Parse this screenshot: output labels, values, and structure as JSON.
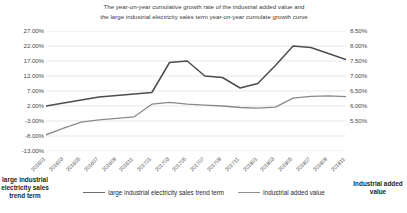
{
  "chart_data": {
    "type": "line",
    "title": "The year-on-year cumulative growth rate of the industrial added value and the large industrial electricity sales term year-on-year cumulate growth curve",
    "title_line1": "The year-on-year cumulative growth rate of the industrial added value and",
    "title_line2": "the large industrial electricity sales term year-on-year cumulate growth curve",
    "xlabel": "",
    "ylabel_left": "large industrial electricity sales trend term",
    "ylabel_right": "Industrial added value",
    "grid": true,
    "legend_position": "bottom",
    "x": [
      "201601",
      "201603",
      "201605",
      "201607",
      "201609",
      "201611",
      "201701",
      "201703",
      "201705",
      "201707",
      "201709",
      "201711",
      "201801",
      "201803",
      "201805",
      "201807",
      "201809",
      "201811"
    ],
    "xtick_labels": [
      "201601",
      "201603",
      "201605",
      "201607",
      "201609",
      "201611",
      "201701",
      "201703",
      "201705",
      "201707",
      "201709",
      "201711",
      "201801",
      "201803",
      "201805",
      "201807",
      "201809",
      "201811"
    ],
    "ylim_left": [
      -13.0,
      27.0
    ],
    "ytick_labels_left": [
      "27.00%",
      "22.00%",
      "17.00%",
      "12.00%",
      "7.00%",
      "2.00%",
      "-3.00%",
      "-8.00%",
      "-13.00%"
    ],
    "ytick_values_left": [
      27.0,
      22.0,
      17.0,
      12.0,
      7.0,
      2.0,
      -3.0,
      -8.0,
      -13.0
    ],
    "ylim_right": [
      5.5,
      8.5
    ],
    "ytick_labels_right": [
      "8.50%",
      "8.00%",
      "7.50%",
      "7.00%",
      "6.50%",
      "6.00%",
      "5.50%"
    ],
    "ytick_values_right": [
      8.5,
      8.0,
      7.5,
      7.0,
      6.5,
      6.0,
      5.5
    ],
    "series": [
      {
        "name": "large industrial electricity sales trend term",
        "axis": "left",
        "color": "#8a8a8a",
        "values": [
          -7.6,
          -5.4,
          -3.4,
          -2.6,
          -2.1,
          -1.6,
          2.6,
          3.2,
          2.6,
          2.3,
          2.0,
          1.5,
          1.3,
          1.6,
          4.6,
          5.2,
          5.4,
          5.1
        ]
      },
      {
        "name": "Industrial added value",
        "axis": "right",
        "color": "#4d4d4d",
        "values": [
          6.0,
          6.1,
          6.2,
          6.3,
          6.35,
          6.4,
          6.45,
          7.45,
          7.5,
          7.0,
          6.95,
          6.6,
          6.75,
          7.35,
          8.0,
          7.95,
          7.75,
          7.55
        ]
      }
    ],
    "annotations": []
  },
  "legend": {
    "items": [
      {
        "label": "large industrial electricity sales trend term",
        "color": "#6f6f6f"
      },
      {
        "label": "Industrial added value",
        "color": "#8f8f8f"
      }
    ]
  },
  "axis_titles": {
    "left": "large industrial electricity sales trend term",
    "right": "Industrial added value"
  }
}
